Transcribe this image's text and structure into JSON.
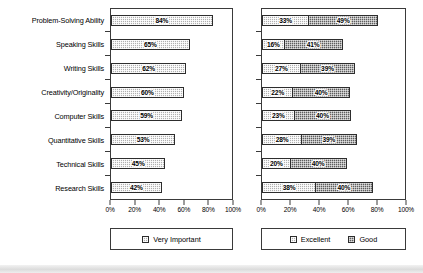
{
  "chart_data": [
    {
      "id": "very-important",
      "type": "bar",
      "orientation": "horizontal",
      "title": "",
      "xlabel": "",
      "ylabel": "",
      "xlim": [
        0,
        100
      ],
      "xticks": [
        0,
        20,
        40,
        60,
        80,
        100
      ],
      "xticklabels": [
        "0%",
        "20%",
        "40%",
        "60%",
        "80%",
        "100%"
      ],
      "grid": false,
      "legend_position": "bottom",
      "categories": [
        "Problem-Solving Ability",
        "Speaking Skills",
        "Writing Skills",
        "Creativity/Originality",
        "Computer Skills",
        "Quantitative Skills",
        "Technical Skills",
        "Research Skills"
      ],
      "series": [
        {
          "name": "Very Important",
          "color": "#b0b0b0",
          "values": [
            84,
            65,
            62,
            60,
            59,
            53,
            45,
            42
          ],
          "labels": [
            "84%",
            "65%",
            "62%",
            "60%",
            "59%",
            "53%",
            "45%",
            "42%"
          ]
        }
      ]
    },
    {
      "id": "excellent-good",
      "type": "bar",
      "orientation": "horizontal",
      "stacked": true,
      "title": "",
      "xlabel": "",
      "ylabel": "",
      "xlim": [
        0,
        100
      ],
      "xticks": [
        0,
        20,
        40,
        60,
        80,
        100
      ],
      "xticklabels": [
        "0%",
        "20%",
        "40%",
        "60%",
        "80%",
        "100%"
      ],
      "grid": false,
      "legend_position": "bottom",
      "categories": [
        "Problem-Solving Ability",
        "Speaking Skills",
        "Writing Skills",
        "Creativity/Originality",
        "Computer Skills",
        "Quantitative Skills",
        "Technical Skills",
        "Research Skills"
      ],
      "series": [
        {
          "name": "Excellent",
          "color": "#b0b0b0",
          "values": [
            33,
            16,
            27,
            22,
            23,
            28,
            20,
            38
          ],
          "labels": [
            "33%",
            "16%",
            "27%",
            "22%",
            "23%",
            "28%",
            "20%",
            "38%"
          ]
        },
        {
          "name": "Good",
          "color": "#5e5e5e",
          "values": [
            49,
            41,
            39,
            40,
            40,
            39,
            40,
            40
          ],
          "labels": [
            "49%",
            "41%",
            "39%",
            "40%",
            "40%",
            "39%",
            "40%",
            "40%"
          ]
        }
      ]
    }
  ]
}
